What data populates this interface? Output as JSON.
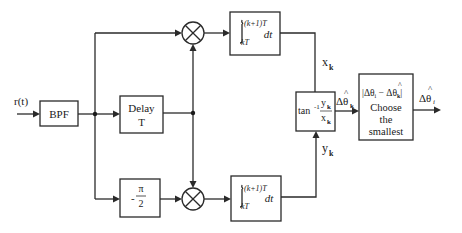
{
  "diagram": {
    "input_label": "r(t)",
    "bpf": {
      "label": "BPF"
    },
    "delay": {
      "line1": "Delay",
      "line2": "T"
    },
    "phase_shift": {
      "sign": "-",
      "numerator": "π",
      "denominator": "2"
    },
    "multiplier_top": {
      "symbol": "multiplier"
    },
    "multiplier_bottom": {
      "symbol": "multiplier"
    },
    "integrator_top": {
      "upper": "(k+1)T",
      "lower": "kT",
      "dt": "dt"
    },
    "integrator_bottom": {
      "upper": "(k+1)T",
      "lower": "kT",
      "dt": "dt"
    },
    "x_label": {
      "base": "x",
      "sub": "k"
    },
    "y_label": {
      "base": "y",
      "sub": "k"
    },
    "arctan": {
      "func": "tan",
      "exp": "-1",
      "num_base": "y",
      "num_sub": "k",
      "den_base": "x",
      "den_sub": "k"
    },
    "delta_theta_k": {
      "delta": "Δ",
      "hat": "^",
      "theta": "θ",
      "sub": "k"
    },
    "chooser": {
      "expr_left": "|Δθ",
      "expr_sub_i": "i",
      "expr_mid": " − Δ",
      "expr_theta": "θ",
      "expr_sub_k": "k",
      "expr_right": "|",
      "hat": "^",
      "line1": "Choose",
      "line2": "the",
      "line3": "smallest"
    },
    "output": {
      "delta": "Δ",
      "hat": "^",
      "theta": "θ",
      "sub": "i"
    }
  }
}
